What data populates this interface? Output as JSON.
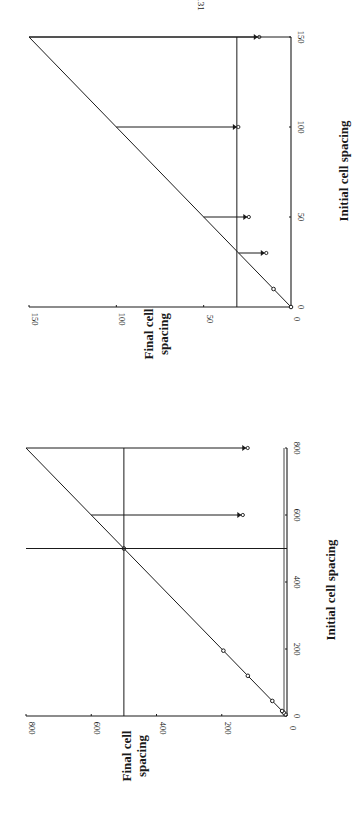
{
  "page": {
    "number_text": "131",
    "orientation": "rotated-90-clockwise",
    "ink_color": "#1a1a1a",
    "background": "#ffffff"
  },
  "chart_data": [
    {
      "type": "line",
      "panel": "left",
      "title": "",
      "xlabel": "Initial cell spacing",
      "ylabel": "Final cell spacing",
      "xlim": [
        0,
        800
      ],
      "ylim": [
        0,
        800
      ],
      "x_ticks": [
        0,
        200,
        400,
        600,
        800
      ],
      "y_ticks": [
        0,
        200,
        400,
        600,
        800
      ],
      "grid": false,
      "legend": null,
      "series": [
        {
          "name": "identity line (final = initial)",
          "x": [
            0,
            800
          ],
          "y": [
            0,
            800
          ],
          "style": "line"
        },
        {
          "name": "stable spacings (markers on identity line)",
          "x": [
            5,
            10,
            15,
            45,
            120,
            195,
            500
          ],
          "y": [
            5,
            10,
            15,
            45,
            120,
            195,
            500
          ],
          "style": "markers"
        },
        {
          "name": "reference level",
          "x": [
            0,
            800
          ],
          "y": [
            500,
            500
          ],
          "style": "line"
        },
        {
          "name": "collapse arrows",
          "style": "arrows",
          "arrows": [
            {
              "initial": 600,
              "from_final": 600,
              "to_final": 140
            },
            {
              "initial": 800,
              "from_final": 800,
              "to_final": 125
            }
          ]
        },
        {
          "name": "drop to x-axis at initial 500",
          "style": "line",
          "x": [
            500,
            500
          ],
          "y": [
            0,
            800
          ]
        }
      ]
    },
    {
      "type": "line",
      "panel": "right",
      "title": "",
      "xlabel": "Initial cell spacing",
      "ylabel": "Final cell spacing",
      "xlim": [
        0,
        150
      ],
      "ylim": [
        0,
        150
      ],
      "x_ticks": [
        0,
        50,
        100,
        150
      ],
      "y_ticks": [
        0,
        50,
        100,
        150
      ],
      "grid": false,
      "legend": null,
      "series": [
        {
          "name": "identity line (final = initial)",
          "x": [
            0,
            150
          ],
          "y": [
            0,
            150
          ],
          "style": "line"
        },
        {
          "name": "stable spacings (markers on identity line)",
          "x": [
            0,
            10
          ],
          "y": [
            0,
            10
          ],
          "style": "markers"
        },
        {
          "name": "reference level",
          "x": [
            0,
            150
          ],
          "y": [
            31,
            31
          ],
          "style": "line"
        },
        {
          "name": "collapse arrows",
          "style": "arrows",
          "arrows": [
            {
              "initial": 30,
              "from_final": 30,
              "to_final": 15
            },
            {
              "initial": 50,
              "from_final": 50,
              "to_final": 25
            },
            {
              "initial": 100,
              "from_final": 100,
              "to_final": 31
            },
            {
              "initial": 150,
              "from_final": 150,
              "to_final": 19
            }
          ]
        },
        {
          "name": "drop at initial 150",
          "style": "line",
          "x": [
            150,
            150
          ],
          "y": [
            0,
            150
          ]
        }
      ]
    }
  ],
  "labels": {
    "left": {
      "xlabel": "Initial cell spacing",
      "ylabel_line1": "Final cell",
      "ylabel_line2": "spacing",
      "x_ticks": [
        "0",
        "200",
        "400",
        "600",
        "800"
      ],
      "y_ticks": [
        "0",
        "200",
        "400",
        "600",
        "800"
      ]
    },
    "right": {
      "xlabel": "Initial cell spacing",
      "ylabel_line1": "Final cell",
      "ylabel_line2": "spacing",
      "x_ticks": [
        "0",
        "50",
        "100",
        "150"
      ],
      "y_ticks": [
        "0",
        "50",
        "100",
        "150"
      ]
    }
  }
}
